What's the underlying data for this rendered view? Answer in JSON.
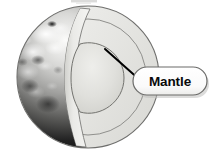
{
  "diagram": {
    "background_color": "#ffffff",
    "globe": {
      "name": "earth-globe",
      "center_x": 88,
      "center_y": 77,
      "radius": 71,
      "surface_description": "grayscale textured Earth surface with clouds and landmasses",
      "surface_light_color": "#f2f2f0",
      "surface_mid_color": "#8d8d8b",
      "surface_dark_color": "#111111",
      "outline_color": "#6e6e6c"
    },
    "layers": [
      {
        "name": "crust-cut-face",
        "label": "",
        "fill_color": "#e3e3e0",
        "edge_color": "#7a7a78"
      },
      {
        "name": "mantle-layer",
        "label": "Mantle",
        "fill_color": "#e9e9e6",
        "edge_color": "#6f6f6d"
      },
      {
        "name": "inner-core-layer",
        "label": "",
        "fill_color": "#dededa",
        "edge_color": "#73736f"
      }
    ],
    "leader_line": {
      "name": "mantle-leader-line",
      "color": "#000000",
      "width": 2,
      "x1": 105,
      "y1": 49,
      "x2": 141,
      "y2": 81
    },
    "callout": {
      "name": "mantle-callout",
      "label": "Mantle",
      "x": 133,
      "y": 67,
      "width": 74,
      "height": 28,
      "fill_color": "#fdfdfd",
      "border_color": "#6b6b69",
      "text_color": "#0a0a0a",
      "shadow_color": "#bfbfbd"
    },
    "top_artifact": {
      "name": "cropped-label-artifact",
      "color": "#b9b9b7"
    }
  }
}
